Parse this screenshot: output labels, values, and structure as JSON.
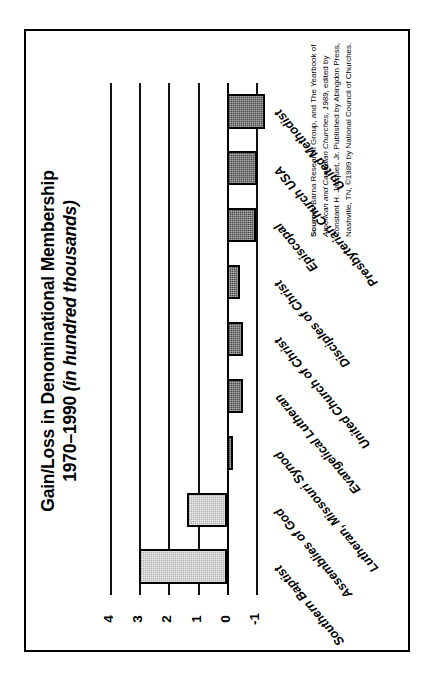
{
  "figure": {
    "title_line1": "Gain/Loss in Denominational Membership",
    "title_line2_years": "1970–1990 ",
    "title_line2_units": "(in hundred thousands)",
    "frame_color": "#000000"
  },
  "source": {
    "lead": "Source: ",
    "text_a": "Barna Research Group, and The Yearbook of ",
    "text_b": "American and Canadian Churches, 1989",
    "text_c": ", edited by Constant H. Jacquet, Jr. Published by Abingdon Press, Nashville, TN, ©1989 by National Council of Churches."
  },
  "axis": {
    "tick_labels": [
      "4",
      "3",
      "2",
      "1",
      "0",
      "-1"
    ],
    "tick_values": [
      4,
      3,
      2,
      1,
      0,
      -1
    ],
    "min": -1,
    "max": 4,
    "units": "hundred thousands",
    "gridlines_visible": true
  },
  "chart_data": {
    "type": "bar",
    "orientation": "horizontal",
    "title": "Gain/Loss in Denominational Membership 1970–1990 (in hundred thousands)",
    "xlabel": "",
    "ylabel": "in hundred thousands",
    "ylim": [
      -1,
      4
    ],
    "grid": true,
    "legend": "none",
    "categories": [
      "Southern Baptist",
      "Assemblies of God",
      "Lutheran, Missouri Synod",
      "Evangelical Lutheran",
      "United Church of Christ",
      "Disciples of Christ",
      "Episcopal",
      "Presbyterian Church USA",
      "United Methodist"
    ],
    "values": [
      3.0,
      1.35,
      -0.2,
      -0.55,
      -0.55,
      -0.45,
      -1.0,
      -1.05,
      -1.3
    ],
    "bar_fills": [
      "light",
      "light",
      "dark",
      "dark",
      "dark",
      "dark",
      "dark",
      "dark",
      "dark"
    ],
    "colors": {
      "gain_fill": "#b3b3b3",
      "loss_fill": "#4a4a4a",
      "bar_outline": "#000000",
      "gridline": "#111111",
      "background": "#ffffff"
    }
  }
}
